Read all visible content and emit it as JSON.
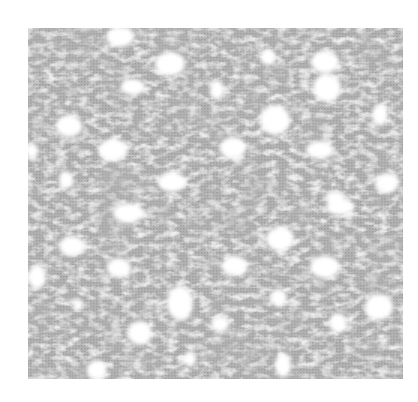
{
  "image": {
    "subject": "crochet lace texture",
    "tone": "grayscale",
    "background_color": "#ffffff",
    "fabric_color": "#a9a9a9",
    "fabric_dark_color": "#8c8c8c",
    "fabric_light_color": "#d4d4d4",
    "hole_color": "#ffffff",
    "fabric_bounds": {
      "x": 28,
      "y": 28,
      "width": 375,
      "height": 351
    },
    "holes": [
      {
        "cx": 120,
        "cy": 37,
        "rx": 14,
        "ry": 10
      },
      {
        "cx": 170,
        "cy": 64,
        "rx": 15,
        "ry": 12
      },
      {
        "cx": 133,
        "cy": 87,
        "rx": 12,
        "ry": 8
      },
      {
        "cx": 69,
        "cy": 126,
        "rx": 13,
        "ry": 11
      },
      {
        "cx": 113,
        "cy": 150,
        "rx": 15,
        "ry": 11
      },
      {
        "cx": 32,
        "cy": 151,
        "rx": 6,
        "ry": 8
      },
      {
        "cx": 66,
        "cy": 180,
        "rx": 7,
        "ry": 9
      },
      {
        "cx": 172,
        "cy": 182,
        "rx": 14,
        "ry": 10
      },
      {
        "cx": 268,
        "cy": 57,
        "rx": 8,
        "ry": 8
      },
      {
        "cx": 325,
        "cy": 62,
        "rx": 14,
        "ry": 11
      },
      {
        "cx": 327,
        "cy": 88,
        "rx": 14,
        "ry": 14
      },
      {
        "cx": 217,
        "cy": 90,
        "rx": 7,
        "ry": 10
      },
      {
        "cx": 275,
        "cy": 120,
        "rx": 15,
        "ry": 15
      },
      {
        "cx": 380,
        "cy": 115,
        "rx": 8,
        "ry": 11
      },
      {
        "cx": 233,
        "cy": 148,
        "rx": 13,
        "ry": 11
      },
      {
        "cx": 320,
        "cy": 150,
        "rx": 14,
        "ry": 9
      },
      {
        "cx": 387,
        "cy": 183,
        "rx": 12,
        "ry": 10
      },
      {
        "cx": 335,
        "cy": 197,
        "rx": 10,
        "ry": 6
      },
      {
        "cx": 128,
        "cy": 213,
        "rx": 15,
        "ry": 10
      },
      {
        "cx": 72,
        "cy": 246,
        "rx": 13,
        "ry": 10
      },
      {
        "cx": 119,
        "cy": 268,
        "rx": 12,
        "ry": 10
      },
      {
        "cx": 37,
        "cy": 277,
        "rx": 9,
        "ry": 12
      },
      {
        "cx": 78,
        "cy": 305,
        "rx": 5,
        "ry": 6
      },
      {
        "cx": 180,
        "cy": 303,
        "rx": 13,
        "ry": 17
      },
      {
        "cx": 140,
        "cy": 333,
        "rx": 12,
        "ry": 12
      },
      {
        "cx": 190,
        "cy": 359,
        "rx": 6,
        "ry": 8
      },
      {
        "cx": 97,
        "cy": 370,
        "rx": 10,
        "ry": 10
      },
      {
        "cx": 340,
        "cy": 207,
        "rx": 14,
        "ry": 8
      },
      {
        "cx": 280,
        "cy": 239,
        "rx": 14,
        "ry": 12
      },
      {
        "cx": 235,
        "cy": 266,
        "rx": 13,
        "ry": 10
      },
      {
        "cx": 325,
        "cy": 267,
        "rx": 15,
        "ry": 11
      },
      {
        "cx": 279,
        "cy": 298,
        "rx": 8,
        "ry": 9
      },
      {
        "cx": 379,
        "cy": 307,
        "rx": 14,
        "ry": 13
      },
      {
        "cx": 220,
        "cy": 324,
        "rx": 9,
        "ry": 8
      },
      {
        "cx": 338,
        "cy": 323,
        "rx": 9,
        "ry": 10
      },
      {
        "cx": 283,
        "cy": 365,
        "rx": 8,
        "ry": 12
      },
      {
        "cx": 218,
        "cy": 322,
        "rx": 6,
        "ry": 5
      },
      {
        "cx": 140,
        "cy": 214,
        "rx": 6,
        "ry": 5
      }
    ]
  }
}
